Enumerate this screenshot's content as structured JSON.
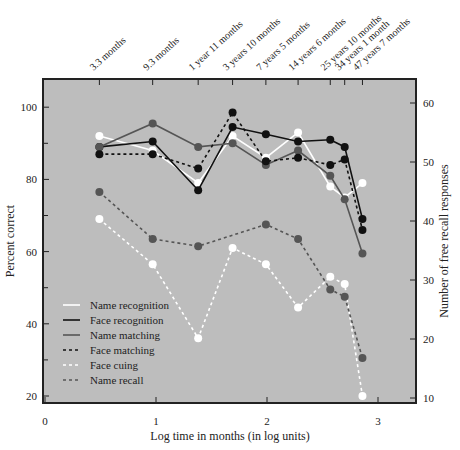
{
  "chart_data": {
    "type": "line",
    "title": "",
    "xlabel": "Log time in months (in log units)",
    "ylabel": "Percent correct",
    "y2label": "Number of free recall responses",
    "xlim": [
      0,
      3.35
    ],
    "ylim": [
      18,
      108
    ],
    "y2lim": [
      10,
      62
    ],
    "xticks": [
      0,
      1,
      2,
      3
    ],
    "yticks": [
      20,
      40,
      60,
      80,
      100
    ],
    "y2ticks": [
      10,
      20,
      30,
      40,
      50,
      60
    ],
    "top_labels": [
      "3.3 months",
      "9.3 months",
      "1 year 11 months",
      "3 years 10 months",
      "7 years 5 months",
      "14 years 6 months",
      "25 years 10 months",
      "34 years 1 month",
      "47 years 7 months"
    ],
    "x": [
      0.49,
      0.97,
      1.38,
      1.69,
      1.99,
      2.28,
      2.57,
      2.7,
      2.86
    ],
    "legend_position": "lower-left",
    "series": [
      {
        "name": "Name recognition",
        "color": "#ffffff",
        "dash": "solid",
        "axis": "left",
        "values": [
          92,
          88,
          79,
          92,
          86,
          93,
          78,
          75,
          79
        ]
      },
      {
        "name": "Face recognition",
        "color": "#111111",
        "dash": "solid",
        "axis": "left",
        "values": [
          89,
          90.5,
          77,
          94.5,
          92.5,
          90.5,
          91,
          89,
          69
        ]
      },
      {
        "name": "Name matching",
        "color": "#555555",
        "dash": "solid",
        "axis": "left",
        "values": [
          89,
          95.5,
          89,
          90,
          84,
          88,
          81,
          74.5,
          59.5
        ]
      },
      {
        "name": "Face matching",
        "color": "#111111",
        "dash": "dashed",
        "axis": "left",
        "values": [
          87,
          87,
          83,
          98.5,
          85,
          86,
          84,
          85.5,
          66
        ]
      },
      {
        "name": "Face cuing",
        "color": "#ffffff",
        "dash": "dashed",
        "axis": "left",
        "values": [
          69,
          56.5,
          36,
          61,
          56.5,
          44.5,
          53,
          51,
          20
        ]
      },
      {
        "name": "Name recall",
        "color": "#555555",
        "dash": "dashed",
        "axis": "left",
        "values": [
          76.5,
          63.5,
          61.5,
          null,
          67.5,
          63.5,
          49.5,
          47.5,
          30.5
        ]
      }
    ]
  }
}
